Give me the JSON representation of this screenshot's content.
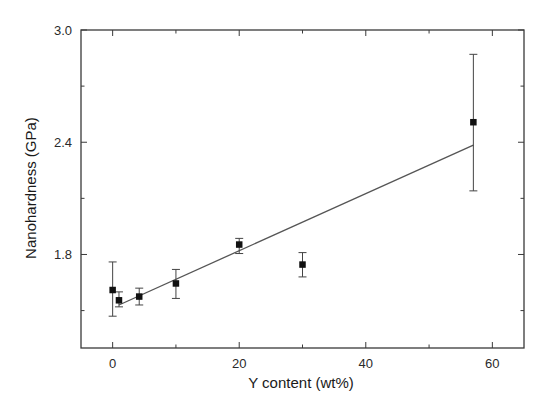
{
  "chart_data": {
    "type": "scatter",
    "title": "",
    "xlabel": "Y content (wt%)",
    "ylabel": "Nanohardness (GPa)",
    "xlim": [
      -5,
      65
    ],
    "ylim": [
      1.3,
      3.0
    ],
    "x_ticks": [
      0,
      20,
      40,
      60
    ],
    "x_tick_labels": [
      "0",
      "20",
      "40",
      "60"
    ],
    "x_minor_ticks": [
      10,
      30,
      50
    ],
    "y_ticks": [
      1.8,
      2.4,
      3.0
    ],
    "y_tick_labels": [
      "1.8",
      "2.4",
      "3.0"
    ],
    "y_minor_ticks": [
      1.5,
      2.1,
      2.7
    ],
    "grid": false,
    "legend": null,
    "series": [
      {
        "name": "Nanohardness",
        "marker": "filled-square",
        "color": "#111111",
        "points": [
          {
            "x": 0,
            "y": 1.61,
            "err_low": 1.47,
            "err_high": 1.76
          },
          {
            "x": 1,
            "y": 1.555,
            "err_low": 1.52,
            "err_high": 1.6
          },
          {
            "x": 4.2,
            "y": 1.575,
            "err_low": 1.53,
            "err_high": 1.62
          },
          {
            "x": 10,
            "y": 1.645,
            "err_low": 1.565,
            "err_high": 1.72
          },
          {
            "x": 20,
            "y": 1.853,
            "err_low": 1.805,
            "err_high": 1.886
          },
          {
            "x": 30,
            "y": 1.746,
            "err_low": 1.68,
            "err_high": 1.81
          },
          {
            "x": 57,
            "y": 2.507,
            "err_low": 2.14,
            "err_high": 2.87
          }
        ]
      },
      {
        "name": "Linear fit",
        "type": "line",
        "color": "#555555",
        "x": [
          1,
          57
        ],
        "values": [
          1.53,
          2.385
        ]
      }
    ]
  }
}
